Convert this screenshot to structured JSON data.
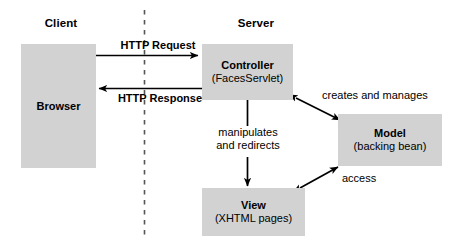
{
  "diagram": {
    "background_color": "#ffffff",
    "box_fill_color": "#d2d2d2",
    "line_color": "#000000",
    "zones": [
      {
        "id": "client",
        "label": "Client"
      },
      {
        "id": "server",
        "label": "Server"
      }
    ],
    "divider": {
      "style": "dashed",
      "orientation": "vertical"
    },
    "nodes": [
      {
        "id": "browser",
        "title": "Browser",
        "subtitle": ""
      },
      {
        "id": "controller",
        "title": "Controller",
        "subtitle": "(FacesServlet)"
      },
      {
        "id": "model",
        "title": "Model",
        "subtitle": "(backing bean)"
      },
      {
        "id": "view",
        "title": "View",
        "subtitle": "(XHTML pages)"
      }
    ],
    "edges": [
      {
        "id": "http-request",
        "label": "HTTP Request",
        "from": "browser",
        "to": "controller",
        "arrow": "single",
        "emphasis": "bold"
      },
      {
        "id": "http-response",
        "label": "HTTP Response",
        "from": "controller",
        "to": "browser",
        "arrow": "single",
        "emphasis": "bold"
      },
      {
        "id": "creates-and-manages",
        "label": "creates and manages",
        "from": "controller",
        "to": "model",
        "arrow": "double",
        "emphasis": "normal"
      },
      {
        "id": "manipulates-and-redirects",
        "label_line1": "manipulates",
        "label_line2": "and redirects",
        "from": "controller",
        "to": "view",
        "arrow": "single",
        "emphasis": "normal"
      },
      {
        "id": "access",
        "label": "access",
        "from": "view",
        "to": "model",
        "arrow": "double",
        "emphasis": "normal"
      }
    ]
  }
}
